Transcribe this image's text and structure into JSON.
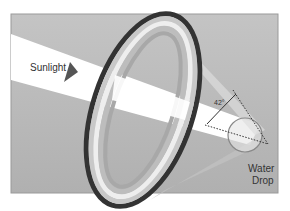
{
  "diagram": {
    "labels": {
      "sunlight": "Sunlight",
      "angle": "42°",
      "water_drop_line1": "Water",
      "water_drop_line2": "Drop"
    },
    "colors": {
      "background_panel": "#b8b8b8",
      "beam": "#ffffff",
      "ring_outer": "#333333",
      "ring_band": "#c8c8c8",
      "ring_light": "#eeeeee",
      "ring_inner": "#a8a8a8"
    }
  }
}
